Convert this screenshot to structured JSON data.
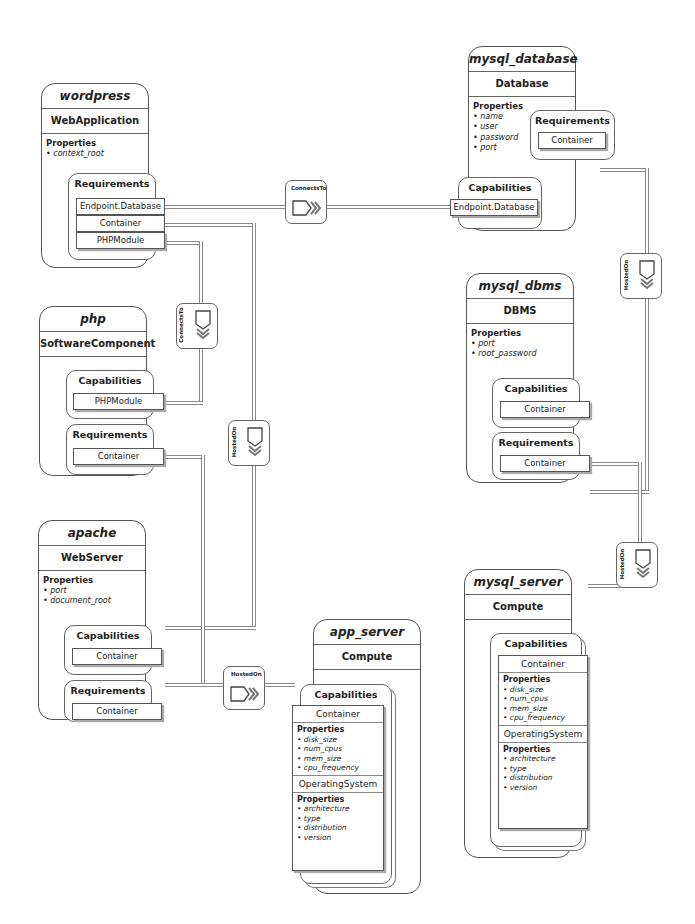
{
  "nodes": {
    "wordpress": {
      "name": "wordpress",
      "type": "WebApplication",
      "properties_label": "Properties",
      "properties": [
        "context_root"
      ],
      "requirements_label": "Requirements",
      "requirements": [
        "Endpoint.Database",
        "Container",
        "PHPModule"
      ]
    },
    "php": {
      "name": "php",
      "type": "SoftwareComponent",
      "capabilities_label": "Capabilities",
      "capabilities": [
        "PHPModule"
      ],
      "requirements_label": "Requirements",
      "requirements": [
        "Container"
      ]
    },
    "apache": {
      "name": "apache",
      "type": "WebServer",
      "properties_label": "Properties",
      "properties": [
        "port",
        "document_root"
      ],
      "capabilities_label": "Capabilities",
      "capabilities": [
        "Container"
      ],
      "requirements_label": "Requirements",
      "requirements": [
        "Container"
      ]
    },
    "app_server": {
      "name": "app_server",
      "type": "Compute",
      "capabilities_label": "Capabilities",
      "container": {
        "label": "Container",
        "properties_label": "Properties",
        "properties": [
          "disk_size",
          "num_cpus",
          "mem_size",
          "cpu_frequency"
        ]
      },
      "os": {
        "label": "OperatingSystem",
        "properties_label": "Properties",
        "properties": [
          "architecture",
          "type",
          "distribution",
          "version"
        ]
      }
    },
    "mysql_database": {
      "name": "mysql_database",
      "type": "Database",
      "properties_label": "Properties",
      "properties": [
        "name",
        "user",
        "password",
        "port"
      ],
      "requirements_label": "Requirements",
      "requirements": [
        "Container"
      ],
      "capabilities_label": "Capabilities",
      "capabilities": [
        "Endpoint.Database"
      ]
    },
    "mysql_dbms": {
      "name": "mysql_dbms",
      "type": "DBMS",
      "properties_label": "Properties",
      "properties": [
        "port",
        "root_password"
      ],
      "capabilities_label": "Capabilities",
      "capabilities": [
        "Container"
      ],
      "requirements_label": "Requirements",
      "requirements": [
        "Container"
      ]
    },
    "mysql_server": {
      "name": "mysql_server",
      "type": "Compute",
      "capabilities_label": "Capabilities",
      "container": {
        "label": "Container",
        "properties_label": "Properties",
        "properties": [
          "disk_size",
          "num_cpus",
          "mem_size",
          "cpu_frequency"
        ]
      },
      "os": {
        "label": "OperatingSystem",
        "properties_label": "Properties",
        "properties": [
          "architecture",
          "type",
          "distribution",
          "version"
        ]
      }
    }
  },
  "relationships": [
    {
      "label": "ConnectsTo",
      "from": "wordpress.Endpoint.Database",
      "to": "mysql_database.Endpoint.Database"
    },
    {
      "label": "ConnectsTo",
      "from": "wordpress.PHPModule",
      "to": "php.PHPModule"
    },
    {
      "label": "HostedOn",
      "from": "wordpress.Container",
      "to": "apache.Container"
    },
    {
      "label": "HostedOn",
      "from": "apache.Container",
      "to": "app_server.Container"
    },
    {
      "label": "HostedOn",
      "from": "mysql_database.Container",
      "to": "mysql_dbms.Container"
    },
    {
      "label": "HostedOn",
      "from": "mysql_dbms.Container",
      "to": "mysql_server.Container"
    }
  ],
  "bullet": "•"
}
